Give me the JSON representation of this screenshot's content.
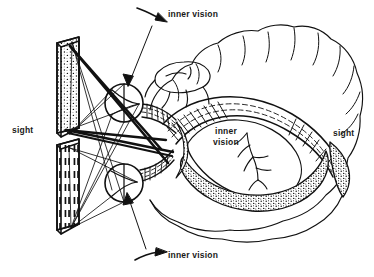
{
  "figure": {
    "type": "line-art anatomical diagram",
    "background_color": "#ffffff",
    "ink_color": "#111111"
  },
  "labels": {
    "inner_vision_top": "inner vision",
    "inner_vision_center_line1": "inner",
    "inner_vision_center_line2": "vision",
    "inner_vision_bottom": "inner vision",
    "sight_left": "sight",
    "sight_right": "sight"
  },
  "parts": {
    "panel_upper": "stippled-visual-field-panel",
    "panel_lower": "dashed-visual-field-panel",
    "eye_upper": "upper-eye-globe",
    "eye_lower": "lower-eye-globe",
    "optic_chiasm": "crossing-ray-bundle",
    "brain": "brain-sagittal-outline",
    "cortex_gyri": "cerebral-cortex-gyri",
    "corpus_callosum": "hatched-corpus-callosum-band",
    "stippled_tract": "stippled-ventral-tract",
    "cerebellum": "cerebellum-lobules",
    "ventricle_branch": "branching-ventricle-structure"
  },
  "annotations": {
    "arrow_top": "arrow-pointing-to-upper-eye",
    "arrow_bottom": "arrow-pointing-to-lower-eye",
    "leader_top": "leader-line-top",
    "leader_bottom": "leader-line-bottom"
  },
  "colors": {
    "ink": "#111111",
    "background": "#ffffff",
    "stipple": "#111111"
  }
}
